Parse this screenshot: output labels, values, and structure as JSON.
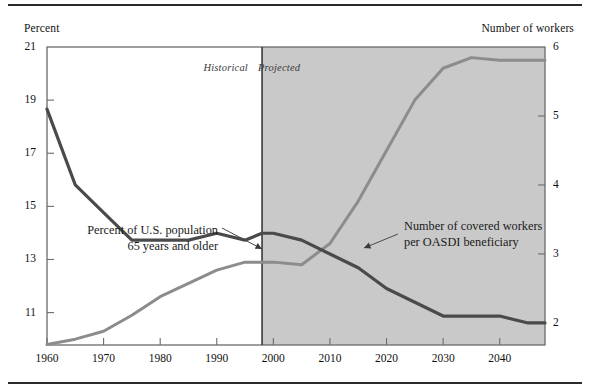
{
  "axis": {
    "left_title": "Percent",
    "right_title": "Number of workers",
    "left_ticks": [
      "21",
      "19",
      "17",
      "15",
      "13",
      "11"
    ],
    "right_ticks": [
      "6",
      "5",
      "4",
      "3",
      "2"
    ],
    "x_ticks": [
      "1960",
      "1970",
      "1980",
      "1990",
      "2000",
      "2010",
      "2020",
      "2030",
      "2040"
    ]
  },
  "bands": {
    "historical": "Historical",
    "projected": "Projected",
    "divider_year": 1998,
    "projected_fill": "#c9c9c9"
  },
  "annotations": {
    "population_line1": "Percent of U.S. population",
    "population_line2": "65 years and older",
    "workers_line1": "Number of covered workers",
    "workers_line2": "per OASDI beneficiary"
  },
  "colors": {
    "population_line": "#8c8c8c",
    "workers_line": "#4a4a4a",
    "frame": "#6b6b6b",
    "text": "#1a1a1a"
  },
  "chart_data": {
    "type": "line",
    "title": "",
    "xlabel": "",
    "ylabel": "Percent",
    "y2label": "Number of workers",
    "xlim": [
      1960,
      2048
    ],
    "ylim": [
      9.78,
      21
    ],
    "y2lim": [
      1.68,
      6
    ],
    "grid": false,
    "legend": "annotations",
    "series": [
      {
        "name": "Percent of U.S. population 65 years and older",
        "axis": "left",
        "units": "percent",
        "color": "#8c8c8c",
        "x": [
          1960,
          1965,
          1970,
          1975,
          1980,
          1985,
          1990,
          1995,
          2000,
          2005,
          2010,
          2015,
          2020,
          2025,
          2030,
          2035,
          2040,
          2045,
          2048
        ],
        "y": [
          9.8,
          10.0,
          10.3,
          10.9,
          11.6,
          12.1,
          12.6,
          12.9,
          12.9,
          12.8,
          13.6,
          15.2,
          17.1,
          19.0,
          20.2,
          20.6,
          20.5,
          20.5,
          20.5
        ]
      },
      {
        "name": "Number of covered workers per OASDI beneficiary",
        "axis": "right",
        "units": "workers per beneficiary",
        "color": "#4a4a4a",
        "x": [
          1960,
          1965,
          1970,
          1975,
          1980,
          1985,
          1990,
          1995,
          1998,
          2000,
          2005,
          2010,
          2015,
          2020,
          2025,
          2030,
          2035,
          2040,
          2045,
          2048
        ],
        "y": [
          5.1,
          4.0,
          3.6,
          3.2,
          3.2,
          3.2,
          3.3,
          3.2,
          3.3,
          3.3,
          3.2,
          3.0,
          2.8,
          2.5,
          2.3,
          2.1,
          2.1,
          2.1,
          2.0,
          2.0
        ]
      }
    ]
  }
}
